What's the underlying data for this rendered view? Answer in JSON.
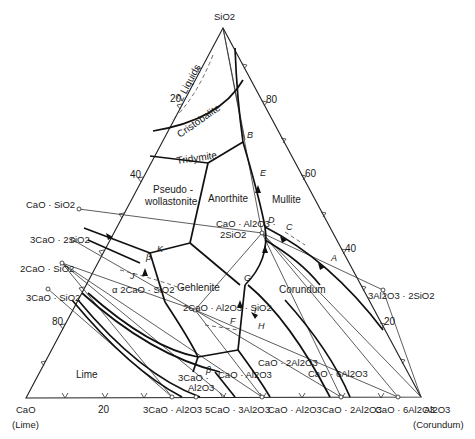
{
  "diagram": {
    "type": "ternary phase diagram",
    "vertices": {
      "top": "SiO2",
      "left": "CaO",
      "left_sub": "(Lime)",
      "right": "Al2O3",
      "right_sub": "(Corundum)"
    },
    "left_edge_ticks": [
      "20",
      "40",
      "80"
    ],
    "right_edge_ticks": [
      "80",
      "60",
      "40",
      "20"
    ],
    "bottom_ticks": [
      "20"
    ],
    "compounds": {
      "cs": "CaO · SiO2",
      "c3s2": "3CaO · 2SiO2",
      "c2s": "2CaO · SiO2",
      "c3s": "3CaO · SiO2",
      "c3a": "3CaO · Al2O3",
      "c5a3": "5CaO · 3Al2O3",
      "ca": "CaO · Al2O3",
      "ca2": "CaO · 2Al2O3",
      "ca6": "CaO · 6Al2O3",
      "mullite": "3Al2O3 · 2SiO2",
      "anorthite_l1": "CaO · Al2O3 ·",
      "anorthite_l2": "2SiO2",
      "gehlenite": "2CaO · Al2O3 · SiO2",
      "a_c2s": "α 2CaO · SiO2"
    },
    "inner_labels": {
      "ca_in": "CaO · Al2O3",
      "ca2_in": "CaO · 2Al2O3",
      "ca6_in": "CaO · 6Al2O3",
      "c3a_in_l1": "3CaO ·",
      "c3a_in_l2": "Al2O3"
    },
    "phase_fields": {
      "liquids": "2 Liquids",
      "cristobalite": "Cristobalite",
      "tridymite": "Tridymite",
      "pseudo_l1": "Pseudo -",
      "pseudo_l2": "wollastonite",
      "anorthite": "Anorthite",
      "mullite": "Mullite",
      "gehlenite": "Gehlenite",
      "corundum": "Corundum",
      "lime": "Lime"
    },
    "points": [
      "A",
      "B",
      "C",
      "D",
      "E",
      "F",
      "G",
      "H",
      "I",
      "J",
      "K",
      "β",
      "β"
    ]
  }
}
